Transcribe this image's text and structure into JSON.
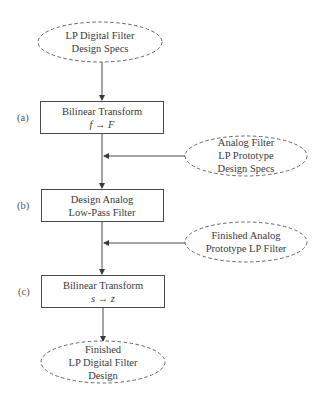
{
  "diagram": {
    "start": {
      "lines": [
        "LP Digital Filter",
        "Design Specs"
      ]
    },
    "steps": [
      {
        "label": "(a)",
        "lines": [
          "Bilinear Transform",
          "f → F"
        ]
      },
      {
        "label": "(b)",
        "lines": [
          "Design Analog",
          "Low-Pass Filter"
        ]
      },
      {
        "label": "(c)",
        "lines": [
          "Bilinear Transform",
          "s → z"
        ]
      }
    ],
    "inputs": [
      {
        "lines": [
          "Analog Filter",
          "LP Prototype",
          "Design Specs"
        ]
      },
      {
        "lines": [
          "Finished Analog",
          "Prototype LP Filter"
        ]
      }
    ],
    "end": {
      "lines": [
        "Finished",
        "LP Digital Filter",
        "Design"
      ]
    }
  }
}
